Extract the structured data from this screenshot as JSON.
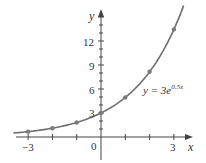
{
  "chart_data": {
    "type": "line",
    "title": "",
    "xlabel": "x",
    "ylabel": "y",
    "annotation": "y = 3e^{0.5x}",
    "annotation_parts": {
      "lhs": "y = 3e",
      "exp": "0.5x"
    },
    "x_tick_labels": [
      "−3",
      "0",
      "3"
    ],
    "y_tick_labels": [
      "3",
      "6",
      "9",
      "12"
    ],
    "xlim": [
      -3.7,
      3.8
    ],
    "ylim": [
      -1.5,
      16
    ],
    "grid": false,
    "series": [
      {
        "name": "y = 3e^{0.5x}",
        "color": "#6e6e6e",
        "x": [
          -3,
          -2,
          -1,
          0,
          1,
          2,
          3
        ],
        "y": [
          0.67,
          1.1,
          1.82,
          3.0,
          4.95,
          8.15,
          13.45
        ]
      }
    ],
    "origin_label": "0"
  }
}
